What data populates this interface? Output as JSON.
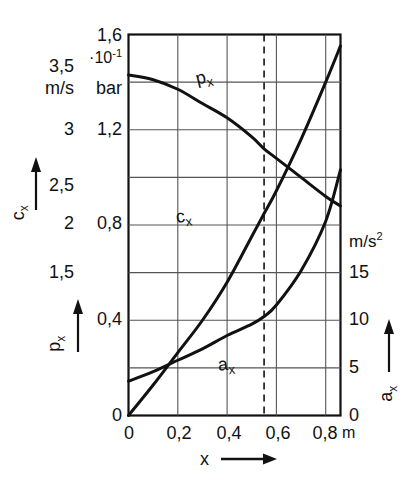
{
  "figure": {
    "kind": "technical-line-chart",
    "background": "#ffffff",
    "ink": "#111111",
    "grid_color": "#555555"
  },
  "axes": {
    "x": {
      "label": "x",
      "arrow": "⟶",
      "unit": "m",
      "ticks": [
        "0",
        "0,2",
        "0,4",
        "0,6",
        "0,8"
      ],
      "tick_values": [
        0,
        0.2,
        0.4,
        0.6,
        0.8
      ],
      "range": [
        0,
        0.86
      ]
    },
    "left_outer": {
      "name": "c_x",
      "symbol": "c",
      "subscript": "x",
      "unit": "m/s",
      "arrow": "↑",
      "ticks": [
        "3,5",
        "3",
        "2,5",
        "2",
        "1,5"
      ],
      "tick_values": [
        3.5,
        3,
        2.5,
        2,
        1.5
      ],
      "range": [
        1.5,
        3.5
      ]
    },
    "left_inner": {
      "name": "p_x",
      "symbol": "p",
      "subscript": "x",
      "unit": "bar",
      "exponent_text": "·10",
      "exponent_power": "-1",
      "arrow": "↑",
      "ticks": [
        "1,6",
        "1,2",
        "0,8",
        "0,4",
        "0"
      ],
      "tick_values": [
        1.6,
        1.2,
        0.8,
        0.4,
        0
      ],
      "range": [
        0,
        1.6
      ]
    },
    "right": {
      "name": "a_x",
      "symbol": "a",
      "subscript": "x",
      "unit": "m/s",
      "unit_exponent": "2",
      "arrow": "↑",
      "ticks": [
        "15",
        "10",
        "5",
        "0"
      ],
      "tick_values": [
        15,
        10,
        5,
        0
      ],
      "range": [
        0,
        20
      ]
    }
  },
  "annotations": {
    "marker_line": {
      "name": "dashed-marker",
      "style": "dashed",
      "x_value": 0.55
    },
    "curve_labels": [
      {
        "id": "px",
        "text": "p",
        "sub": "x"
      },
      {
        "id": "cx",
        "text": "c",
        "sub": "x"
      },
      {
        "id": "ax",
        "text": "a",
        "sub": "x"
      }
    ]
  },
  "chart_data": {
    "type": "line",
    "title": "",
    "xlabel": "x",
    "ylabel": "p_x / c_x / a_x",
    "xlim": [
      0,
      0.86
    ],
    "grid": true,
    "legend": "inline-curve-labels",
    "x_unit": "m",
    "series": [
      {
        "name": "p_x",
        "label": "pₓ",
        "unit": "bar",
        "scale_note": "·10⁻¹ bar, left inner axis 0–1,6",
        "axis": "left_inner",
        "ylim": [
          0,
          1.6
        ],
        "x": [
          0.0,
          0.1,
          0.2,
          0.3,
          0.4,
          0.5,
          0.55,
          0.6,
          0.7,
          0.8,
          0.86
        ],
        "y": [
          1.43,
          1.41,
          1.37,
          1.31,
          1.25,
          1.17,
          1.12,
          1.08,
          1.0,
          0.92,
          0.88
        ]
      },
      {
        "name": "c_x",
        "label": "cₓ",
        "unit": "m/s",
        "axis": "left_outer",
        "ylim": [
          1.5,
          3.5
        ],
        "x": [
          0.0,
          0.1,
          0.2,
          0.3,
          0.4,
          0.5,
          0.55,
          0.6,
          0.7,
          0.8,
          0.86
        ],
        "y": [
          1.5,
          1.66,
          1.83,
          2.0,
          2.2,
          2.44,
          2.56,
          2.68,
          2.95,
          3.25,
          3.44
        ]
      },
      {
        "name": "a_x",
        "label": "aₓ",
        "unit": "m/s²",
        "axis": "right",
        "ylim": [
          0,
          20
        ],
        "x": [
          0.0,
          0.1,
          0.2,
          0.3,
          0.4,
          0.5,
          0.55,
          0.6,
          0.7,
          0.8,
          0.86
        ],
        "y": [
          1.8,
          2.3,
          2.9,
          3.5,
          4.2,
          4.8,
          5.2,
          5.8,
          7.6,
          10.2,
          12.9
        ]
      }
    ],
    "marker_x": 0.55
  }
}
